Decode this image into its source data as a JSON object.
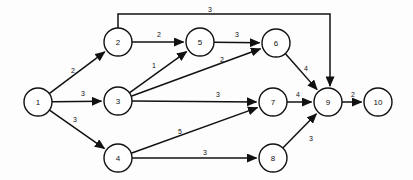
{
  "diagram": {
    "type": "directed-weighted-graph",
    "title": "",
    "canvas": {
      "width": 413,
      "height": 180
    },
    "node_radius": 14,
    "colors": {
      "background": "#fdfdfd",
      "stroke": "#111111",
      "node_fill": "#ffffff"
    },
    "nodes": [
      {
        "id": "1",
        "label": "1",
        "x": 38,
        "y": 102
      },
      {
        "id": "2",
        "label": "2",
        "x": 118,
        "y": 42
      },
      {
        "id": "3",
        "label": "3",
        "x": 118,
        "y": 101
      },
      {
        "id": "4",
        "label": "4",
        "x": 118,
        "y": 158
      },
      {
        "id": "5",
        "label": "5",
        "x": 200,
        "y": 42
      },
      {
        "id": "6",
        "label": "6",
        "x": 276,
        "y": 43
      },
      {
        "id": "7",
        "label": "7",
        "x": 273,
        "y": 102
      },
      {
        "id": "8",
        "label": "8",
        "x": 273,
        "y": 158
      },
      {
        "id": "9",
        "label": "9",
        "x": 328,
        "y": 102
      },
      {
        "id": "10",
        "label": "10",
        "x": 378,
        "y": 102
      }
    ],
    "edges": [
      {
        "id": "e1-2",
        "from": "1",
        "to": "2",
        "weight": "2",
        "label_x": 73,
        "label_y": 70,
        "routing": "straight"
      },
      {
        "id": "e1-3",
        "from": "1",
        "to": "3",
        "weight": "3",
        "label_x": 83,
        "label_y": 93,
        "routing": "straight"
      },
      {
        "id": "e1-4",
        "from": "1",
        "to": "4",
        "weight": "3",
        "label_x": 75,
        "label_y": 119,
        "routing": "straight"
      },
      {
        "id": "e2-5",
        "from": "2",
        "to": "5",
        "weight": "2",
        "label_x": 159,
        "label_y": 34,
        "routing": "straight"
      },
      {
        "id": "e2-9",
        "from": "2",
        "to": "9",
        "weight": "3",
        "label_x": 210,
        "label_y": 9,
        "routing": "orthogonal-top"
      },
      {
        "id": "e3-5",
        "from": "3",
        "to": "5",
        "weight": "1",
        "label_x": 154,
        "label_y": 65,
        "routing": "straight"
      },
      {
        "id": "e3-6",
        "from": "3",
        "to": "6",
        "weight": "2",
        "label_x": 222,
        "label_y": 59,
        "routing": "straight"
      },
      {
        "id": "e3-7",
        "from": "3",
        "to": "7",
        "weight": "3",
        "label_x": 218,
        "label_y": 94,
        "routing": "straight"
      },
      {
        "id": "e5-6",
        "from": "5",
        "to": "6",
        "weight": "3",
        "label_x": 237,
        "label_y": 34,
        "routing": "straight"
      },
      {
        "id": "e6-9",
        "from": "6",
        "to": "9",
        "weight": "4",
        "label_x": 306,
        "label_y": 68,
        "routing": "straight"
      },
      {
        "id": "e4-7",
        "from": "4",
        "to": "7",
        "weight": "5",
        "label_x": 180,
        "label_y": 131,
        "routing": "straight"
      },
      {
        "id": "e4-8",
        "from": "4",
        "to": "8",
        "weight": "3",
        "label_x": 205,
        "label_y": 152,
        "routing": "straight"
      },
      {
        "id": "e7-9",
        "from": "7",
        "to": "9",
        "weight": "4",
        "label_x": 298,
        "label_y": 94,
        "routing": "straight"
      },
      {
        "id": "e8-9",
        "from": "8",
        "to": "9",
        "weight": "3",
        "label_x": 311,
        "label_y": 138,
        "routing": "straight"
      },
      {
        "id": "e9-10",
        "from": "9",
        "to": "10",
        "weight": "2",
        "label_x": 353,
        "label_y": 94,
        "routing": "straight"
      }
    ]
  }
}
